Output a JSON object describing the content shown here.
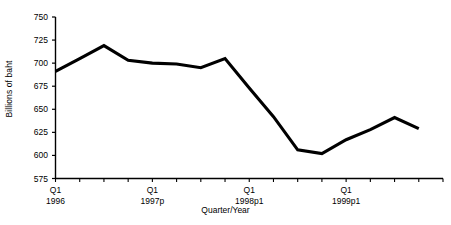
{
  "chart_data": {
    "type": "line",
    "title": "",
    "xlabel": "Quarter/Year",
    "ylabel": "Billions of baht",
    "ylim": [
      575,
      750
    ],
    "ytick_values": [
      750,
      725,
      700,
      675,
      650,
      625,
      600,
      575
    ],
    "ytick_labels": [
      "750",
      "725",
      "700",
      "675",
      "650",
      "625",
      "600",
      "575"
    ],
    "grid": false,
    "legend": "none",
    "series_color": "#000000",
    "categories": [
      "Q1 1996",
      "Q2 1996",
      "Q3 1996",
      "Q4 1996",
      "Q1 1997p",
      "Q2 1997p",
      "Q3 1997p",
      "Q4 1997p",
      "Q1 1998p1",
      "Q2 1998p1",
      "Q3 1998p1",
      "Q4 1998p1",
      "Q1 1999p1",
      "Q2 1999p1",
      "Q3 1999p1",
      "Q4 1999p1"
    ],
    "values": [
      691,
      705,
      719,
      703,
      700,
      699,
      695,
      705,
      673,
      642,
      606,
      602,
      617,
      628,
      641,
      629
    ],
    "x_major_ticks": [
      {
        "index": 0,
        "quarter": "Q1",
        "year": "1996"
      },
      {
        "index": 4,
        "quarter": "Q1",
        "year": "1997p"
      },
      {
        "index": 8,
        "quarter": "Q1",
        "year": "1998p1"
      },
      {
        "index": 12,
        "quarter": "Q1",
        "year": "1999p1"
      }
    ]
  }
}
